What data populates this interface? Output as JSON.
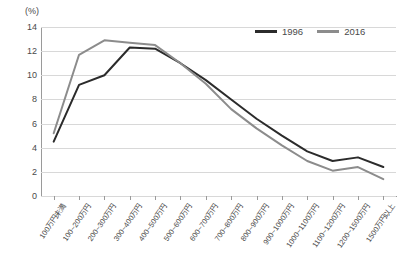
{
  "chart_data": {
    "type": "line",
    "title": "",
    "xlabel": "",
    "ylabel": "(%)",
    "ylim": [
      0,
      14
    ],
    "ytick_values": [
      0,
      2,
      4,
      6,
      8,
      10,
      12,
      14
    ],
    "grid": true,
    "legend_position": "top-right",
    "categories": [
      "100万円未満",
      "100~200万円",
      "200~300万円",
      "300~400万円",
      "400~500万円",
      "500~600万円",
      "600~700万円",
      "700~800万円",
      "800~900万円",
      "900~1000万円",
      "1000~1100万円",
      "1100~1200万円",
      "1200~1500万円",
      "1500万円以上"
    ],
    "series": [
      {
        "name": "1996",
        "color": "#2b2b2b",
        "values": [
          4.5,
          9.2,
          10.0,
          12.3,
          12.2,
          11.0,
          9.6,
          8.0,
          6.4,
          5.0,
          3.7,
          2.9,
          3.2,
          2.4
        ]
      },
      {
        "name": "2016",
        "color": "#8c8c8c",
        "values": [
          5.2,
          11.7,
          12.9,
          12.7,
          12.5,
          11.0,
          9.3,
          7.2,
          5.6,
          4.2,
          2.9,
          2.1,
          2.4,
          1.4
        ]
      }
    ]
  },
  "legend": {
    "entries": [
      {
        "label": "1996"
      },
      {
        "label": "2016"
      }
    ]
  },
  "axis": {
    "unit_label": "(%)"
  }
}
